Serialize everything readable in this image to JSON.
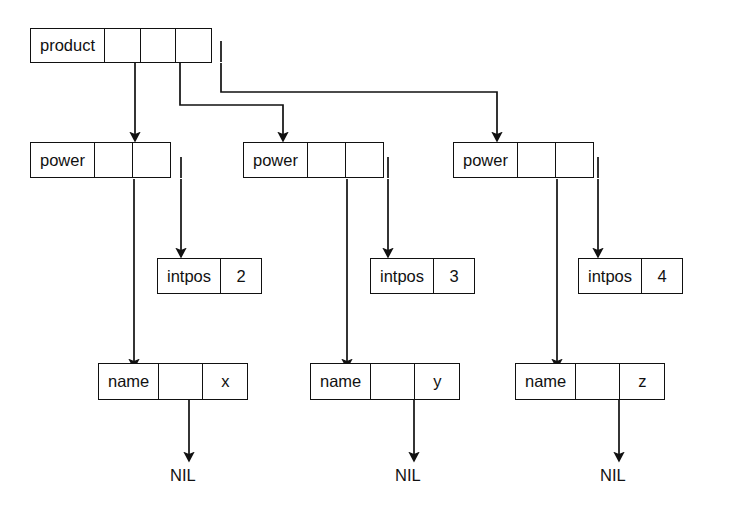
{
  "diagram": {
    "stroke_color": "#111111",
    "background_color": "#ffffff",
    "nodes": {
      "product": {
        "label": "product",
        "pointers": 3
      },
      "power1": {
        "label": "power",
        "pointers": 2
      },
      "power2": {
        "label": "power",
        "pointers": 2
      },
      "power3": {
        "label": "power",
        "pointers": 2
      },
      "intpos1": {
        "label": "intpos",
        "value": "2"
      },
      "intpos2": {
        "label": "intpos",
        "value": "3"
      },
      "intpos3": {
        "label": "intpos",
        "value": "4"
      },
      "name1": {
        "label": "name",
        "value": "x"
      },
      "name2": {
        "label": "name",
        "value": "y"
      },
      "name3": {
        "label": "name",
        "value": "z"
      }
    },
    "terminals": [
      {
        "label": "NIL"
      },
      {
        "label": "NIL"
      },
      {
        "label": "NIL"
      }
    ]
  }
}
